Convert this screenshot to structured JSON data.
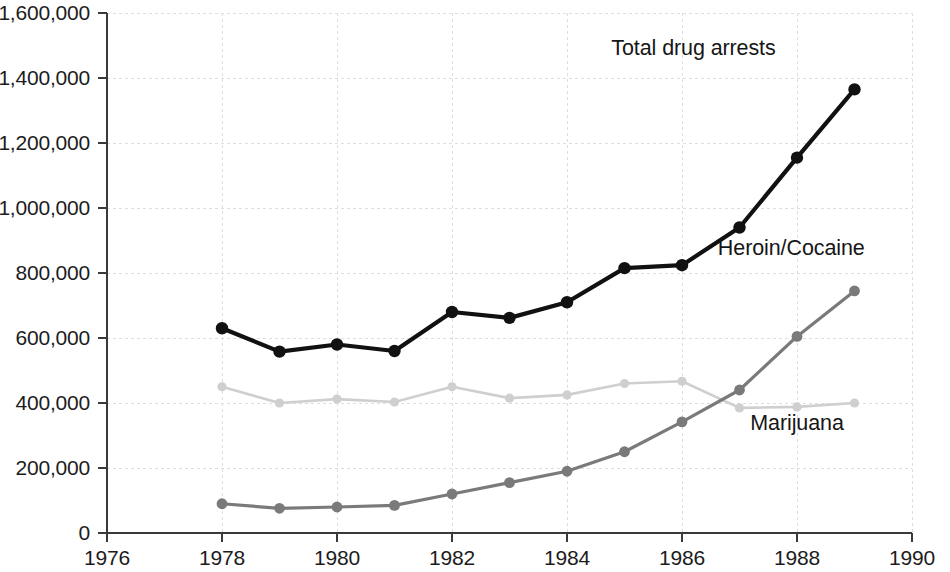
{
  "chart_data": {
    "type": "line",
    "title": "",
    "subtitle": "",
    "xlabel": "",
    "ylabel": "",
    "x": [
      1978,
      1979,
      1980,
      1981,
      1982,
      1983,
      1984,
      1985,
      1986,
      1987,
      1988,
      1989
    ],
    "xlim": [
      1976,
      1990
    ],
    "ylim": [
      0,
      1600000
    ],
    "x_tick_labels": [
      "1976",
      "1978",
      "1980",
      "1982",
      "1984",
      "1986",
      "1988",
      "1990"
    ],
    "x_tick_values": [
      1976,
      1978,
      1980,
      1982,
      1984,
      1986,
      1988,
      1990
    ],
    "y_tick_labels": [
      "0",
      "200,000",
      "400,000",
      "600,000",
      "800,000",
      "1,000,000",
      "1,200,000",
      "1,400,000",
      "1,600,000"
    ],
    "y_tick_values": [
      0,
      200000,
      400000,
      600000,
      800000,
      1000000,
      1200000,
      1400000,
      1600000
    ],
    "grid": true,
    "legend_position": "inline-labels",
    "series": [
      {
        "name": "Total drug arrests",
        "color": "#111111",
        "marker": "circle",
        "values": [
          630000,
          558000,
          580000,
          560000,
          680000,
          662000,
          710000,
          815000,
          824000,
          940000,
          1155000,
          1365000
        ]
      },
      {
        "name": "Heroin/Cocaine",
        "color": "#7a7a7a",
        "marker": "circle",
        "values": [
          90000,
          76000,
          80000,
          85000,
          120000,
          155000,
          190000,
          250000,
          342000,
          440000,
          605000,
          745000
        ]
      },
      {
        "name": "Marijuana",
        "color": "#cfcfcf",
        "marker": "circle",
        "values": [
          450000,
          400000,
          412000,
          403000,
          450000,
          415000,
          425000,
          460000,
          467000,
          385000,
          388000,
          400000
        ]
      }
    ],
    "annotations": [
      {
        "text": "Total drug arrests",
        "x": 1986.2,
        "y": 1470000
      },
      {
        "text": "Heroin/Cocaine",
        "x": 1987.9,
        "y": 855000
      },
      {
        "text": "Marijuana",
        "x": 1988.0,
        "y": 318000
      }
    ]
  },
  "colors": {
    "total": "#111111",
    "heroin_cocaine": "#7a7a7a",
    "marijuana": "#cfcfcf",
    "axis": "#3a3a3a",
    "grid": "#dedede",
    "background": "#ffffff"
  }
}
